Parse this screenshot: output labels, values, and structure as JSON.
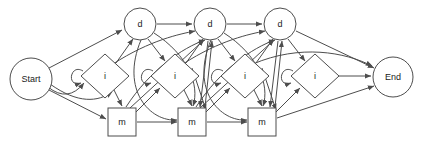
{
  "diagram": {
    "type": "state-transition-diagram",
    "title": "",
    "background_color": "#ffffff",
    "stroke_color": "#4d4d4d",
    "label_color": "#1a1a1a",
    "node_fill": "#ffffff",
    "terminals": {
      "start": {
        "label": "Start",
        "shape": "ellipse",
        "cx": 31,
        "cy": 79,
        "rx": 21,
        "ry": 21
      },
      "end": {
        "label": "End",
        "shape": "ellipse",
        "cx": 393,
        "cy": 77,
        "rx": 20,
        "ry": 20
      }
    },
    "columns": [
      {
        "index": 1,
        "delete": {
          "label": "d",
          "shape": "circle",
          "cx": 140,
          "cy": 24,
          "r": 16
        },
        "insert": {
          "label": "i",
          "shape": "diamond",
          "cx": 105,
          "cy": 76,
          "rx": 24,
          "ry": 22,
          "self_loop": true
        },
        "match": {
          "label": "m",
          "shape": "square",
          "cx": 122,
          "cy": 122,
          "w": 28,
          "h": 28
        }
      },
      {
        "index": 2,
        "delete": {
          "label": "d",
          "shape": "circle",
          "cx": 210,
          "cy": 24,
          "r": 16
        },
        "insert": {
          "label": "i",
          "shape": "diamond",
          "cx": 175,
          "cy": 76,
          "rx": 24,
          "ry": 22,
          "self_loop": true
        },
        "match": {
          "label": "m",
          "shape": "square",
          "cx": 192,
          "cy": 122,
          "w": 28,
          "h": 28
        }
      },
      {
        "index": 3,
        "delete": {
          "label": "d",
          "shape": "circle",
          "cx": 280,
          "cy": 24,
          "r": 16
        },
        "insert": {
          "label": "i",
          "shape": "diamond",
          "cx": 245,
          "cy": 76,
          "rx": 24,
          "ry": 22,
          "self_loop": true
        },
        "match": {
          "label": "m",
          "shape": "square",
          "cx": 262,
          "cy": 122,
          "w": 28,
          "h": 28
        }
      },
      {
        "index": 4,
        "delete": null,
        "insert": {
          "label": "i",
          "shape": "diamond",
          "cx": 315,
          "cy": 76,
          "rx": 24,
          "ry": 22,
          "self_loop": true
        },
        "match": null
      }
    ],
    "legend": {
      "delete_state": "d",
      "insert_state": "i",
      "match_state": "m",
      "start_state": "Start",
      "end_state": "End"
    },
    "edge_count": 43,
    "arrowhead": "filled-triangle"
  }
}
